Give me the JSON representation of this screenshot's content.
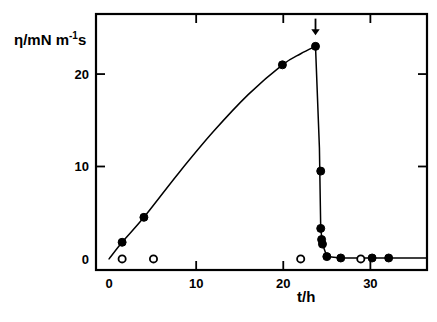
{
  "chart_data": {
    "type": "scatter",
    "title": "",
    "xlabel": "t/h",
    "ylabel": "η/mN m⁻¹ s",
    "ylabel_parts": {
      "prefix": "η/mN m",
      "exponent": "-1",
      "suffix": "s"
    },
    "xlim": [
      -1.5,
      36.5
    ],
    "ylim": [
      -1.2,
      26.5
    ],
    "xticks": [
      0,
      10,
      20,
      30
    ],
    "xtick_labels": [
      "0",
      "10",
      "20",
      "30"
    ],
    "yticks": [
      0,
      10,
      20
    ],
    "ytick_labels": [
      "0",
      "10",
      "20"
    ],
    "grid": false,
    "legend": null,
    "legend_position": "none",
    "axis_frame": "box",
    "tick_direction": "in_on_top_and_right_out_on_bottom_and_left",
    "series": [
      {
        "name": "viscosity (filled circles)",
        "marker": "filled-circle",
        "color": "#000000",
        "points": [
          {
            "x": 1.5,
            "y": 1.8
          },
          {
            "x": 4.0,
            "y": 4.5
          },
          {
            "x": 19.9,
            "y": 21.0
          },
          {
            "x": 23.7,
            "y": 23.0
          },
          {
            "x": 24.3,
            "y": 9.5
          },
          {
            "x": 24.3,
            "y": 3.3
          },
          {
            "x": 24.4,
            "y": 2.1
          },
          {
            "x": 24.5,
            "y": 1.6
          },
          {
            "x": 25.0,
            "y": 0.25
          },
          {
            "x": 26.6,
            "y": 0.1
          },
          {
            "x": 30.2,
            "y": 0.1
          },
          {
            "x": 32.1,
            "y": 0.1
          }
        ]
      },
      {
        "name": "reference (open circles)",
        "marker": "open-circle",
        "color": "#000000",
        "points": [
          {
            "x": 1.5,
            "y": 0.0
          },
          {
            "x": 5.1,
            "y": 0.0
          },
          {
            "x": 22.0,
            "y": 0.0
          },
          {
            "x": 28.9,
            "y": 0.0
          }
        ]
      }
    ],
    "curve": {
      "name": "fitted curve",
      "description": "smooth rise from origin to peak at t=23.7, then near-vertical drop to baseline at t=25",
      "path_points": [
        {
          "x": 0.0,
          "y": 0.0
        },
        {
          "x": 1.5,
          "y": 1.8
        },
        {
          "x": 4.0,
          "y": 4.5
        },
        {
          "x": 8.0,
          "y": 9.3
        },
        {
          "x": 12.0,
          "y": 13.8
        },
        {
          "x": 16.0,
          "y": 17.8
        },
        {
          "x": 19.9,
          "y": 21.0
        },
        {
          "x": 22.0,
          "y": 22.2
        },
        {
          "x": 23.7,
          "y": 23.0
        },
        {
          "x": 24.15,
          "y": 12.0
        },
        {
          "x": 24.3,
          "y": 3.3
        },
        {
          "x": 24.5,
          "y": 1.6
        },
        {
          "x": 25.0,
          "y": 0.25
        },
        {
          "x": 26.6,
          "y": 0.1
        },
        {
          "x": 36.5,
          "y": 0.1
        }
      ]
    },
    "annotations": [
      {
        "type": "arrow",
        "name": "gelation-arrow",
        "direction": "down",
        "x": 23.7,
        "y_tail": 26.0,
        "y_head": 24.2,
        "label": ""
      }
    ]
  }
}
